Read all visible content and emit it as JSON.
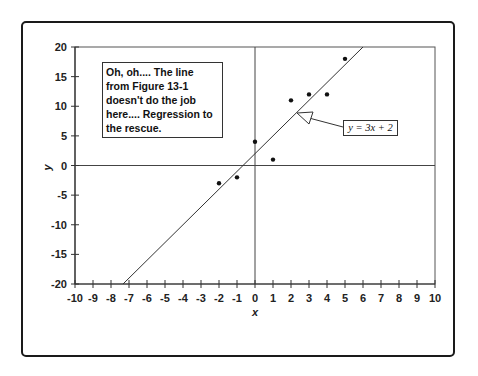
{
  "chart_data": {
    "type": "scatter",
    "title": "",
    "xlabel": "x",
    "ylabel": "y",
    "xlim": [
      -10,
      10
    ],
    "ylim": [
      -20,
      20
    ],
    "x_ticks": [
      -10,
      -9,
      -8,
      -7,
      -6,
      -5,
      -4,
      -3,
      -2,
      -1,
      0,
      1,
      2,
      3,
      4,
      5,
      6,
      7,
      8,
      9,
      10
    ],
    "y_ticks": [
      20,
      15,
      10,
      5,
      0,
      -5,
      -10,
      -15,
      -20
    ],
    "grid": false,
    "series": [
      {
        "name": "data points",
        "type": "scatter",
        "points": [
          {
            "x": -2,
            "y": -3
          },
          {
            "x": -1,
            "y": -2
          },
          {
            "x": 0,
            "y": 4
          },
          {
            "x": 1,
            "y": 1
          },
          {
            "x": 2,
            "y": 11
          },
          {
            "x": 3,
            "y": 12
          },
          {
            "x": 4,
            "y": 12
          },
          {
            "x": 5,
            "y": 18
          }
        ]
      },
      {
        "name": "regression line",
        "type": "line",
        "equation": "y = 3x + 2",
        "slope": 3,
        "intercept": 2
      }
    ],
    "annotations": [
      {
        "text": "Oh, oh....  The line from Figure 13-1 doesn't do the job here....  Regression to the rescue.",
        "position": "upper-left"
      },
      {
        "text": "y = 3x + 2",
        "position": "right",
        "arrow_to_line": true
      }
    ]
  },
  "labels": {
    "note": "Oh, oh....  The line\nfrom Figure 13-1\ndoesn't do the job\nhere....  Regression to\nthe rescue.",
    "equation": "y = 3x + 2",
    "xlabel": "x",
    "ylabel": "y",
    "x_ticks": [
      "-10",
      "-9",
      "-8",
      "-7",
      "-6",
      "-5",
      "-4",
      "-3",
      "-2",
      "-1",
      "0",
      "1",
      "2",
      "3",
      "4",
      "5",
      "6",
      "7",
      "8",
      "9",
      "10"
    ],
    "y_ticks": [
      "20",
      "15",
      "10",
      "5",
      "0",
      "-5",
      "-10",
      "-15",
      "-20"
    ]
  }
}
